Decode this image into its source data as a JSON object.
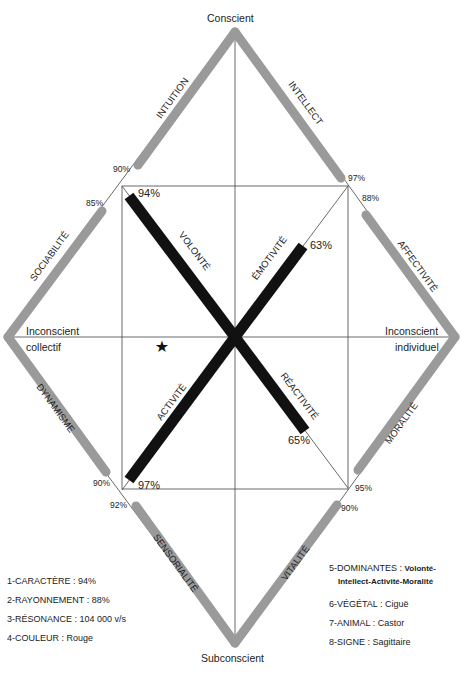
{
  "poles": {
    "top": "Conscient",
    "bottom": "Subconscient",
    "left_line1": "Inconscient",
    "left_line2": "collectif",
    "right_line1": "Inconscient",
    "right_line2": "individuel"
  },
  "outer_axes": [
    {
      "name": "INTUITION",
      "value": "90%"
    },
    {
      "name": "INTELLECT",
      "value": "97%"
    },
    {
      "name": "SOCIABILITÉ",
      "value": "85%"
    },
    {
      "name": "AFFECTIVITÉ",
      "value": "88%"
    },
    {
      "name": "DYNAMISME",
      "value": "90%"
    },
    {
      "name": "MORALITÉ",
      "value": "95%"
    },
    {
      "name": "SENSORIALITÉ",
      "value": "92%"
    },
    {
      "name": "VITALITÉ",
      "value": "90%"
    }
  ],
  "inner_axes": [
    {
      "name": "VOLONTÉ",
      "value": "94%"
    },
    {
      "name": "ÉMOTIVITÉ",
      "value": "63%"
    },
    {
      "name": "ACTIVITÉ",
      "value": "97%"
    },
    {
      "name": "RÉACTIVITÉ",
      "value": "65%"
    }
  ],
  "marker": "★",
  "legend_left": [
    {
      "label": "1-CARACTÈRE",
      "value": "94%"
    },
    {
      "label": "2-RAYONNEMENT",
      "value": "88%"
    },
    {
      "label": "3-RÉSONANCE",
      "value": "104 000 v/s"
    },
    {
      "label": "4-COULEUR",
      "value": "Rouge"
    }
  ],
  "legend_right": [
    {
      "label": "5-DOMINANTES",
      "value": "Volonté-",
      "value2": "Intellect-Activité-Moralité"
    },
    {
      "label": "6-VÉGÉTAL",
      "value": "Ciguë"
    },
    {
      "label": "7-ANIMAL",
      "value": "Castor"
    },
    {
      "label": "8-SIGNE",
      "value": "Sagittaire"
    }
  ],
  "colors": {
    "outer_bar": "#9a9a9a",
    "inner_bar": "#111111",
    "line": "#333333"
  }
}
